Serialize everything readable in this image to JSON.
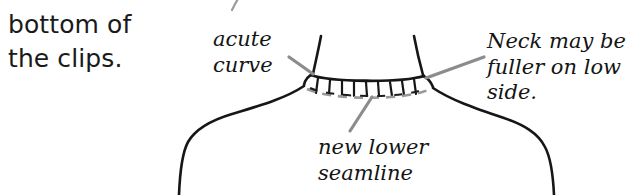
{
  "document": {
    "type": "sewing-instruction-diagram",
    "subject": "neckline with clips and new lower seamline"
  },
  "body_text": {
    "lines": [
      "bottom of",
      "the clips."
    ]
  },
  "callouts": [
    {
      "id": "acute-curve",
      "lines": [
        "acute",
        "curve"
      ],
      "points_to": "left neckline corner"
    },
    {
      "id": "neck-fuller",
      "lines": [
        "Neck may be",
        "fuller on low",
        "side."
      ],
      "points_to": "right neckline corner"
    },
    {
      "id": "new-lower-seamline",
      "lines": [
        "new lower",
        "seamline"
      ],
      "points_to": "dashed seamline below clips"
    }
  ],
  "drawing": {
    "clip_count": 9,
    "ink_color": "#1a1a1a",
    "leader_color": "#8c8c8c",
    "seamline_color": "#9a9a9a",
    "background_color": "#ffffff",
    "elements": [
      "left-neckline-edge",
      "right-neckline-edge",
      "neckline-curve",
      "clip-marks",
      "new-lower-seamline-dashed",
      "left-shoulder-seam",
      "right-shoulder-seam",
      "top-stray-mark"
    ]
  }
}
